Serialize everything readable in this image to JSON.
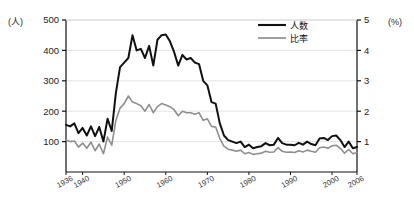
{
  "chart_data": {
    "type": "line",
    "title": "",
    "subtitle": "",
    "xlabel": "",
    "ylabel": "(人)",
    "y2label": "(%)",
    "xlim": [
      1936,
      2006
    ],
    "ylim": [
      0,
      500
    ],
    "y2lim": [
      0,
      5
    ],
    "grid": true,
    "legend_position": "top-right",
    "yticks": [
      100,
      200,
      300,
      400,
      500
    ],
    "ytick_labels": [
      "100",
      "200",
      "300",
      "400",
      "500"
    ],
    "y2ticks": [
      1,
      2,
      3,
      4,
      5
    ],
    "y2tick_labels": [
      "1",
      "2",
      "3",
      "4",
      "5"
    ],
    "xticks": [
      1936,
      1940,
      1950,
      1960,
      1970,
      1980,
      1990,
      2000,
      2006
    ],
    "xtick_labels": [
      "1936",
      "1940",
      "1950",
      "1960",
      "1970",
      "1980",
      "1990",
      "2000",
      "2006"
    ],
    "legend": [
      {
        "name": "人数",
        "color": "#111111",
        "width": 2.1
      },
      {
        "name": "比率",
        "color": "#8f8f8f",
        "width": 1.7
      }
    ],
    "x": [
      1936,
      1937,
      1938,
      1939,
      1940,
      1941,
      1942,
      1943,
      1944,
      1945,
      1946,
      1947,
      1948,
      1949,
      1950,
      1951,
      1952,
      1953,
      1954,
      1955,
      1956,
      1957,
      1958,
      1959,
      1960,
      1961,
      1962,
      1963,
      1964,
      1965,
      1966,
      1967,
      1968,
      1969,
      1970,
      1971,
      1972,
      1973,
      1974,
      1975,
      1976,
      1977,
      1978,
      1979,
      1980,
      1981,
      1982,
      1983,
      1984,
      1985,
      1986,
      1987,
      1988,
      1989,
      1990,
      1991,
      1992,
      1993,
      1994,
      1995,
      1996,
      1997,
      1998,
      1999,
      2000,
      2001,
      2002,
      2003,
      2004,
      2005,
      2006
    ],
    "series": [
      {
        "name": "人数",
        "color": "#111111",
        "axis": "left",
        "unit": "人",
        "values": [
          155,
          150,
          160,
          128,
          145,
          120,
          150,
          118,
          148,
          100,
          175,
          135,
          260,
          345,
          360,
          375,
          450,
          400,
          405,
          375,
          415,
          350,
          435,
          450,
          452,
          430,
          395,
          350,
          385,
          370,
          375,
          360,
          355,
          300,
          285,
          230,
          225,
          160,
          120,
          105,
          100,
          95,
          100,
          82,
          90,
          78,
          82,
          85,
          95,
          88,
          90,
          112,
          95,
          90,
          90,
          88,
          96,
          90,
          100,
          92,
          88,
          110,
          112,
          105,
          118,
          120,
          105,
          82,
          100,
          78,
          82
        ]
      },
      {
        "name": "比率",
        "color": "#8f8f8f",
        "axis": "right",
        "unit": "%",
        "values": [
          105,
          100,
          102,
          82,
          95,
          78,
          98,
          70,
          92,
          60,
          115,
          88,
          170,
          210,
          225,
          250,
          230,
          225,
          218,
          200,
          222,
          195,
          215,
          225,
          220,
          215,
          205,
          185,
          200,
          195,
          195,
          190,
          195,
          170,
          175,
          150,
          148,
          110,
          85,
          75,
          72,
          68,
          72,
          60,
          64,
          58,
          60,
          62,
          68,
          65,
          66,
          80,
          68,
          65,
          66,
          64,
          70,
          66,
          72,
          68,
          65,
          80,
          82,
          78,
          86,
          88,
          78,
          62,
          74,
          60,
          64
        ]
      }
    ]
  }
}
